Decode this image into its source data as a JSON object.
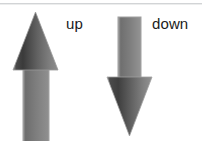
{
  "figure": {
    "width": 202,
    "height": 141,
    "background_color": "#ffffff",
    "top_rule_color": "#d2d4d6",
    "text_color": "#1b1b1b"
  },
  "labels": {
    "up": "up",
    "down": "down"
  },
  "arrows": [
    {
      "id": "up-arrow",
      "direction": "up",
      "label": "up",
      "icon_name": "arrow-up-icon",
      "fill_dark": "#3a3a3a",
      "fill_mid": "#6e6e6e",
      "fill_light": "#8e8e8e",
      "outline_color": "#9a9a9a",
      "bbox": {
        "x": 8,
        "y": 9,
        "width": 54,
        "height": 132
      }
    },
    {
      "id": "down-arrow",
      "direction": "down",
      "label": "down",
      "icon_name": "arrow-down-icon",
      "fill_dark": "#3f3f3f",
      "fill_mid": "#707070",
      "fill_light": "#929292",
      "outline_color": "#a0a0a0",
      "bbox": {
        "x": 104,
        "y": 14,
        "width": 54,
        "height": 124
      }
    }
  ]
}
